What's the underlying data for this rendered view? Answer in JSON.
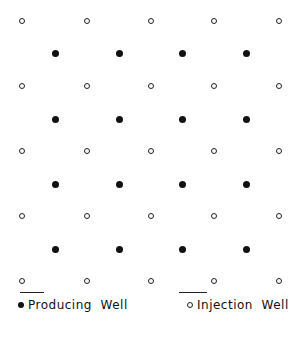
{
  "diagram": {
    "title": "",
    "pattern": "five-spot well pattern",
    "injection_wells": {
      "rows_y": [
        21,
        86,
        151,
        216,
        281
      ],
      "cols_x": [
        22,
        87,
        151,
        214,
        279
      ]
    },
    "producing_wells": {
      "rows_y": [
        53,
        119,
        184,
        249
      ],
      "cols_x": [
        55,
        119,
        182,
        246
      ]
    }
  },
  "legend": {
    "producing": {
      "symbol": "filled-circle",
      "label": "Producing  Well"
    },
    "injection": {
      "symbol": "open-circle",
      "label": "Injection  Well"
    }
  },
  "colors": {
    "ink": "#111111",
    "background": "#ffffff"
  }
}
